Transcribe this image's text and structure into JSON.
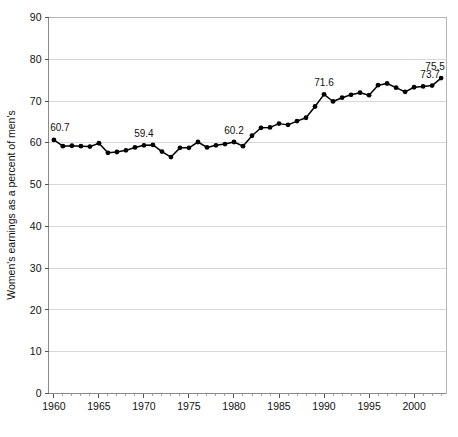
{
  "chart_data": {
    "type": "line",
    "title": "",
    "xlabel": "",
    "ylabel": "Women's earnings as a percent of men's",
    "xlim": [
      1959.4,
      2003.6
    ],
    "ylim": [
      0,
      90
    ],
    "grid": true,
    "legend": "none",
    "y_ticks": [
      0,
      10,
      20,
      30,
      40,
      50,
      60,
      70,
      80,
      90
    ],
    "x_ticks": [
      1960,
      1965,
      1970,
      1975,
      1980,
      1985,
      1990,
      1995,
      2000
    ],
    "x_minor_tick_step": 1,
    "series": [
      {
        "name": "Women's earnings as a percent of men's",
        "x": [
          1960,
          1961,
          1962,
          1963,
          1964,
          1965,
          1966,
          1967,
          1968,
          1969,
          1970,
          1971,
          1972,
          1973,
          1974,
          1975,
          1976,
          1977,
          1978,
          1979,
          1980,
          1981,
          1982,
          1983,
          1984,
          1985,
          1986,
          1987,
          1988,
          1989,
          1990,
          1991,
          1992,
          1993,
          1994,
          1995,
          1996,
          1997,
          1998,
          1999,
          2000,
          2001,
          2002,
          2003
        ],
        "values": [
          60.7,
          59.2,
          59.3,
          59.2,
          59.1,
          59.9,
          57.6,
          57.8,
          58.2,
          58.9,
          59.4,
          59.5,
          57.9,
          56.6,
          58.8,
          58.8,
          60.2,
          58.9,
          59.4,
          59.7,
          60.2,
          59.2,
          61.7,
          63.6,
          63.7,
          64.6,
          64.3,
          65.2,
          66.0,
          68.7,
          71.6,
          69.9,
          70.8,
          71.5,
          72.0,
          71.4,
          73.8,
          74.2,
          73.2,
          72.2,
          73.3,
          73.5,
          73.7,
          75.5
        ]
      }
    ],
    "point_labels": [
      {
        "x": 1960,
        "value": 60.7,
        "text": "60.7"
      },
      {
        "x": 1970,
        "value": 59.4,
        "text": "59.4"
      },
      {
        "x": 1980,
        "value": 60.2,
        "text": "60.2"
      },
      {
        "x": 1990,
        "value": 71.6,
        "text": "71.6"
      },
      {
        "x": 2002,
        "value": 73.7,
        "text": "73.7"
      },
      {
        "x": 2003,
        "value": 75.5,
        "text": "75.5"
      }
    ],
    "colors": {
      "line": "#000000",
      "marker": "#000000",
      "grid": "#d8d8d8",
      "axis": "#8a8a8a",
      "text": "#111111",
      "background": "#ffffff"
    }
  }
}
